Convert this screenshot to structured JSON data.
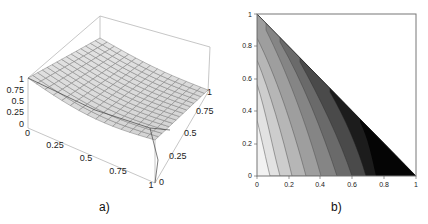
{
  "chart_data": [
    {
      "id": "a",
      "type": "surface3d",
      "caption": "a)",
      "x_ticks": [
        "0",
        "0.25",
        "0.5",
        "0.75",
        "1"
      ],
      "y_ticks": [
        "0",
        "0.25",
        "0.5",
        "0.75",
        "1"
      ],
      "z_ticks": [
        "0",
        "0.25",
        "0.5",
        "0.75",
        "1"
      ],
      "x_range": [
        0,
        1
      ],
      "y_range": [
        0,
        1
      ],
      "z_range": [
        0,
        1
      ],
      "grid_mesh": "15x15",
      "surface_color": "#dcdcdc",
      "mesh_color": "#707070",
      "box": true,
      "description": "Surface decreasing from z=1 at (x=0,y=0) toward lower values at (x=1,y=0); bent ridge lines across mesh"
    },
    {
      "id": "b",
      "type": "contour",
      "caption": "b)",
      "x_ticks": [
        "0",
        "0.2",
        "0.4",
        "0.6",
        "0.8",
        "1"
      ],
      "y_ticks": [
        "0",
        "0.2",
        "0.4",
        "0.6",
        "0.8",
        "1"
      ],
      "x_range": [
        0,
        1
      ],
      "y_range": [
        0,
        1
      ],
      "domain": "triangle x + y <= 1",
      "levels": 9,
      "colormap": "grayscale light (low x) to black (high x)",
      "band_colors": [
        "#f2f2f2",
        "#dedede",
        "#c8c8c8",
        "#b0b0b0",
        "#989898",
        "#7e7e7e",
        "#646464",
        "#3c3c3c",
        "#0a0a0a"
      ]
    }
  ],
  "captions": {
    "a": "a)",
    "b": "b)"
  },
  "plot_a": {
    "z_labels": [
      "1",
      "0.75",
      "0.5",
      "0.25",
      "0"
    ],
    "x_labels": [
      "0",
      "0.25",
      "0.5",
      "0.75",
      "1"
    ],
    "y_labels": [
      "0",
      "0.25",
      "0.5",
      "0.75",
      "1"
    ]
  },
  "plot_b": {
    "x_labels": [
      "0",
      "0.2",
      "0.4",
      "0.6",
      "0.8",
      "1"
    ],
    "y_labels": [
      "0",
      "0.2",
      "0.4",
      "0.6",
      "0.8",
      "1"
    ]
  }
}
